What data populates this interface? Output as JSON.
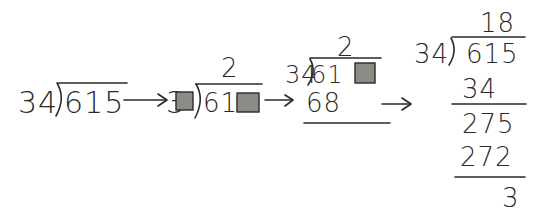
{
  "diagram": {
    "colors": {
      "ink": "#2a2a2a",
      "box_fill": "#8c8c86",
      "background": "#ffffff"
    },
    "arrows": [
      "→",
      "→",
      "→"
    ],
    "stages": [
      {
        "id": "stage-1",
        "divisor": "34",
        "dividend": "615",
        "quotient": ""
      },
      {
        "id": "stage-2",
        "divisor_visible": "3",
        "divisor_hidden_digit": "box",
        "dividend_visible": "61",
        "dividend_hidden_digit": "box",
        "quotient": "2"
      },
      {
        "id": "stage-3",
        "divisor": "34",
        "dividend_visible": "61",
        "dividend_hidden_digit": "box",
        "quotient": "2",
        "product": "68"
      },
      {
        "id": "stage-4",
        "divisor": "34",
        "dividend": "615",
        "quotient": "18",
        "steps": [
          {
            "subtract": "34"
          },
          {
            "remainder_bring_down": "275"
          },
          {
            "subtract": "272"
          },
          {
            "remainder": "3"
          }
        ]
      }
    ]
  }
}
